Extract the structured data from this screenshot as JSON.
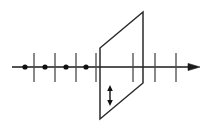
{
  "figure": {
    "title": "Number line intersected by a plane",
    "width": 218,
    "height": 131,
    "background_color": "#ffffff",
    "stroke_color": "#1a1a1a",
    "plane_stroke_color": "#2b2b2b"
  },
  "chart_data": {
    "type": "diagram",
    "title": "Number line intersected by a plane",
    "xlabel": "",
    "ylabel": "",
    "grid": false,
    "legend": "none",
    "axis_line": {
      "name": "main-axis",
      "y": 67,
      "x_start": 12,
      "x_end": 200,
      "arrowhead": "right",
      "arrowhead_x": 200,
      "stroke_width": 1.4
    },
    "dots": [
      {
        "label": "dot-1",
        "x": 25,
        "y": 67,
        "r": 2.6
      },
      {
        "label": "dot-2",
        "x": 45,
        "y": 67,
        "r": 2.6
      },
      {
        "label": "dot-3",
        "x": 66,
        "y": 67,
        "r": 2.6
      },
      {
        "label": "dot-4",
        "x": 86,
        "y": 67,
        "r": 2.6
      }
    ],
    "ticks": [
      {
        "label": "tick-1",
        "x": 34,
        "y_top": 53,
        "y_bottom": 82
      },
      {
        "label": "tick-2",
        "x": 55,
        "y_top": 53,
        "y_bottom": 82
      },
      {
        "label": "tick-3",
        "x": 76,
        "y_top": 53,
        "y_bottom": 82
      },
      {
        "label": "tick-4",
        "x": 96,
        "y_top": 53,
        "y_bottom": 82
      },
      {
        "label": "tick-5",
        "x": 133,
        "y_top": 53,
        "y_bottom": 82
      },
      {
        "label": "tick-6",
        "x": 155,
        "y_top": 53,
        "y_bottom": 82
      },
      {
        "label": "tick-7",
        "x": 176,
        "y_top": 53,
        "y_bottom": 82
      }
    ],
    "plane": {
      "label": "plane-parallelogram",
      "vertices": [
        {
          "x": 143,
          "y": 12
        },
        {
          "x": 100,
          "y": 48
        },
        {
          "x": 100,
          "y": 119
        },
        {
          "x": 143,
          "y": 83
        }
      ],
      "fill": "none",
      "stroke_width": 1.5
    },
    "inner_arrow": {
      "label": "double-headed-vertical-arrow",
      "x": 110,
      "y_top": 86,
      "y_bottom": 105,
      "heads": "both",
      "stroke_width": 1.4
    }
  }
}
